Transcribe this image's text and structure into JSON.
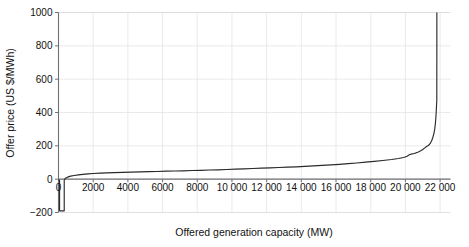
{
  "chart_data": {
    "type": "line",
    "title": "",
    "xlabel": "Offered generation capacity (MW)",
    "ylabel": "Offer price (US $/MWh)",
    "xlim": [
      0,
      22600
    ],
    "ylim": [
      -200,
      1000
    ],
    "grid": true,
    "legend": null,
    "xticks": [
      0,
      2000,
      4000,
      6000,
      8000,
      10000,
      12000,
      14000,
      16000,
      18000,
      20000,
      22000
    ],
    "xticklabels": [
      "0",
      "2000",
      "4000",
      "6000",
      "8000",
      "10 000",
      "12 000",
      "14 000",
      "16 000",
      "18 000",
      "20 000",
      "22 000"
    ],
    "yticks": [
      -200,
      0,
      200,
      400,
      600,
      800,
      1000
    ],
    "yticklabels": [
      "-200",
      "0",
      "200",
      "400",
      "600",
      "800",
      "1000"
    ],
    "series": [
      {
        "name": "Offer stack",
        "color": "#2a2a2a",
        "x": [
          0,
          60,
          60,
          330,
          330,
          400,
          520,
          700,
          900,
          1150,
          1400,
          1700,
          2000,
          2400,
          2800,
          3200,
          3700,
          4200,
          4700,
          5200,
          5700,
          6200,
          6700,
          7200,
          7700,
          8200,
          8700,
          9200,
          9700,
          10200,
          10700,
          11200,
          11700,
          12200,
          12700,
          13200,
          13700,
          14200,
          14700,
          15200,
          15700,
          16200,
          16700,
          17200,
          17700,
          18200,
          18700,
          19200,
          19600,
          19900,
          20100,
          20250,
          20400,
          20500,
          20620,
          20750,
          20880,
          21000,
          21120,
          21220,
          21300,
          21380,
          21450,
          21520,
          21580,
          21640,
          21690,
          21730,
          21760,
          21785,
          21800,
          21810,
          21812,
          21814
        ],
        "y": [
          -5,
          -5,
          -190,
          -190,
          -5,
          5,
          12,
          18,
          22,
          26,
          29,
          32,
          34,
          36,
          38,
          39,
          41,
          42,
          44,
          45,
          46,
          48,
          49,
          50,
          52,
          53,
          55,
          56,
          58,
          60,
          62,
          64,
          66,
          68,
          70,
          72,
          74,
          77,
          80,
          83,
          86,
          89,
          93,
          97,
          102,
          107,
          112,
          118,
          124,
          130,
          138,
          148,
          152,
          154,
          158,
          163,
          170,
          178,
          188,
          196,
          200,
          208,
          218,
          232,
          250,
          272,
          300,
          335,
          375,
          420,
          455,
          468,
          600,
          1000
        ]
      }
    ]
  }
}
